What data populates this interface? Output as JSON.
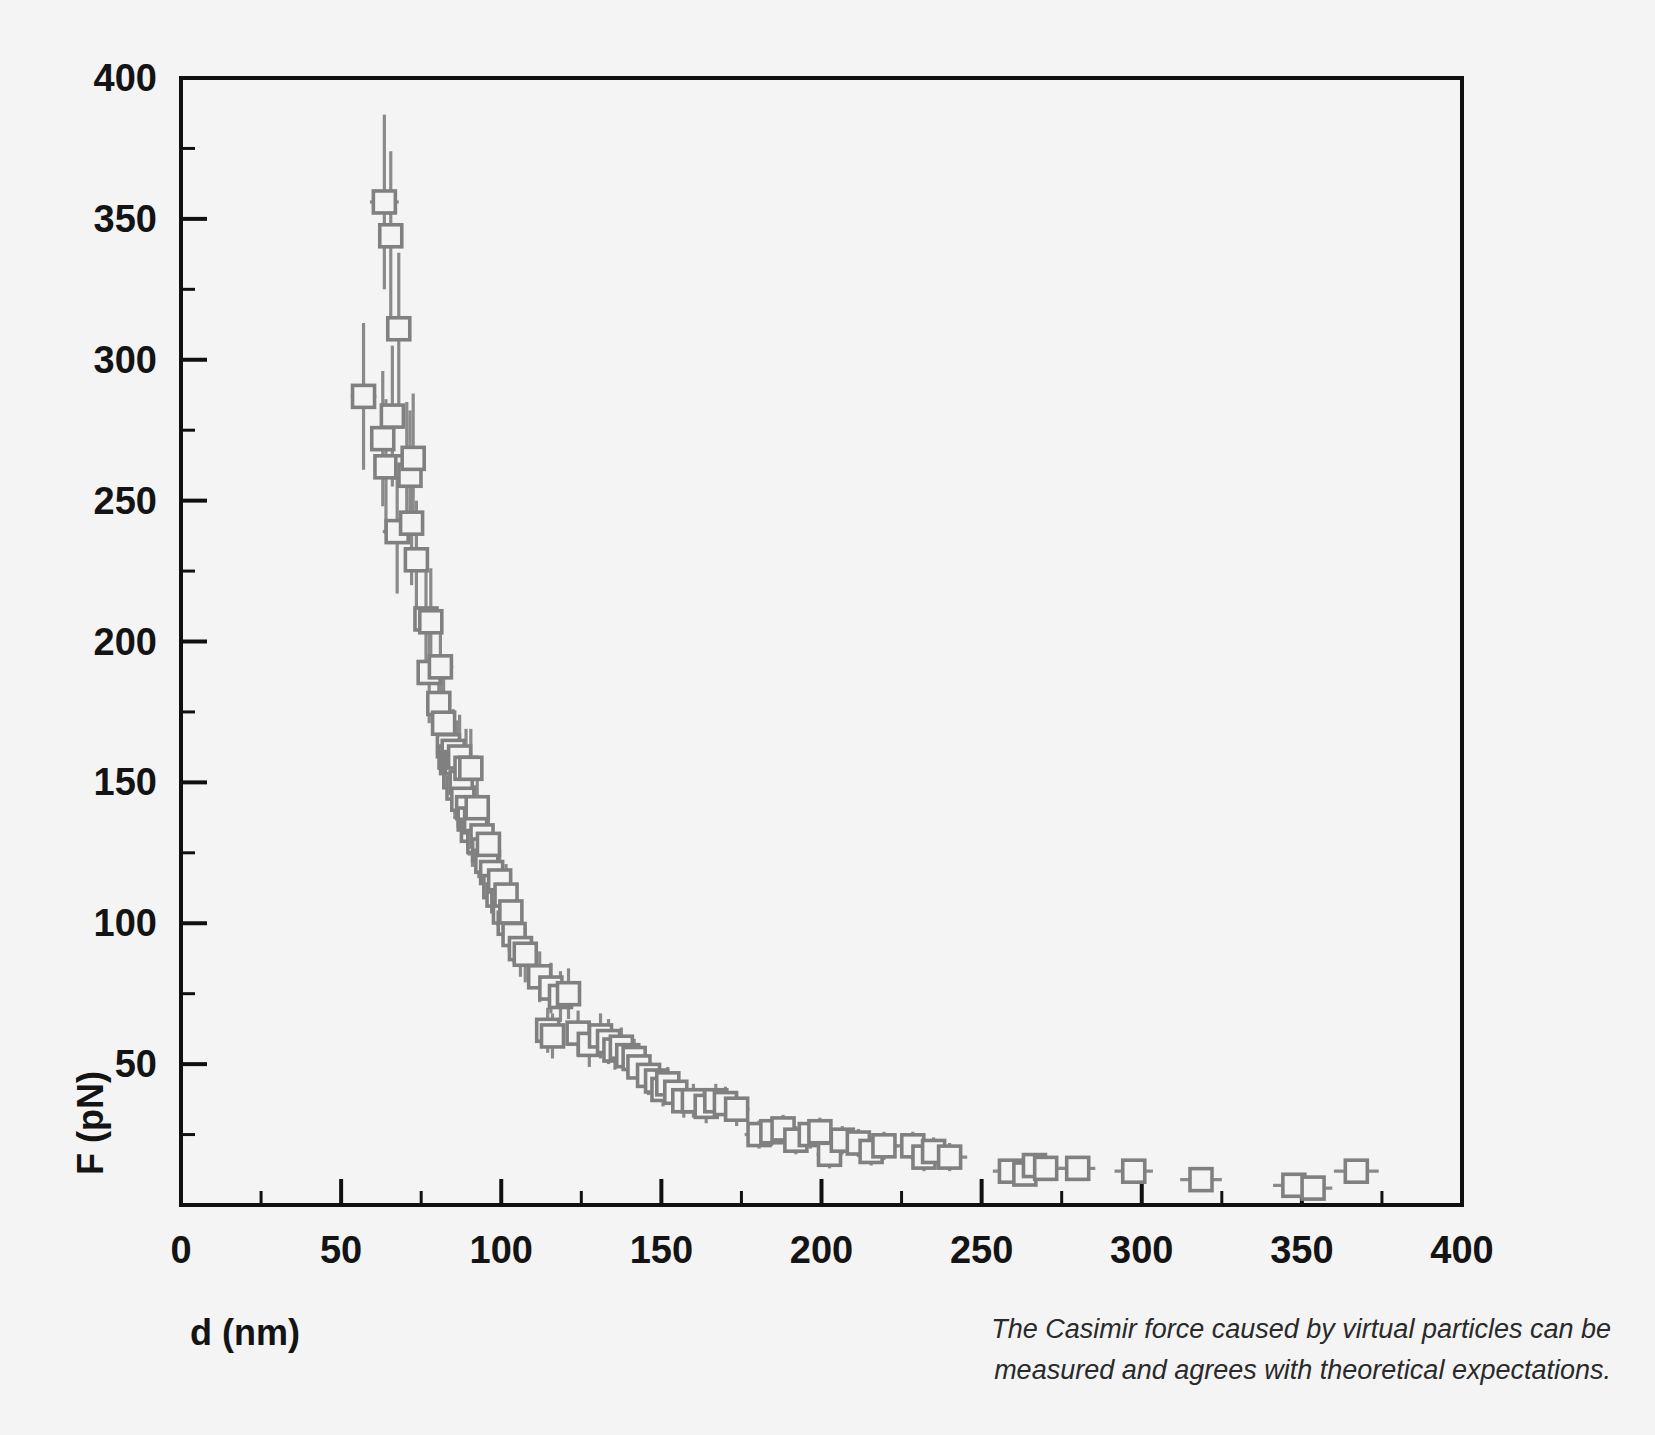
{
  "figure": {
    "background_color": "#f4f4f4",
    "frame_color": "#101010",
    "marker_color": "#808080",
    "errorbar_color": "#8a8a8a",
    "caption_line1": "The Casimir force caused by virtual particles can be",
    "caption_line2": "measured and agrees with theoretical expectations."
  },
  "chart_data": {
    "type": "scatter",
    "title": "",
    "xlabel": "d (nm)",
    "ylabel": "F (pN)",
    "xlim": [
      0,
      400
    ],
    "ylim": [
      0,
      400
    ],
    "xticks": [
      0,
      50,
      100,
      150,
      200,
      250,
      300,
      350,
      400
    ],
    "yticks": [
      0,
      50,
      100,
      150,
      200,
      250,
      300,
      350,
      400
    ],
    "xtick_labels": [
      "0",
      "50",
      "100",
      "150",
      "200",
      "250",
      "300",
      "350",
      "400"
    ],
    "ytick_labels": [
      "0",
      "50",
      "100",
      "150",
      "200",
      "250",
      "300",
      "350",
      "400"
    ],
    "xminor_step": 25,
    "yminor_step": 25,
    "grid": false,
    "legend": null,
    "marker": "open-square",
    "has_error_bars": true,
    "series": [
      {
        "name": "Casimir force measurement",
        "points": [
          {
            "x": 57.0,
            "y": 287,
            "xerr": 4.0,
            "yerr": 26
          },
          {
            "x": 63.5,
            "y": 356,
            "xerr": 4.5,
            "yerr": 31
          },
          {
            "x": 65.5,
            "y": 344,
            "xerr": 3.0,
            "yerr": 30
          },
          {
            "x": 64.0,
            "y": 262,
            "xerr": 3.5,
            "yerr": 24
          },
          {
            "x": 63.0,
            "y": 272,
            "xerr": 3.0,
            "yerr": 24
          },
          {
            "x": 66.0,
            "y": 280,
            "xerr": 3.5,
            "yerr": 25
          },
          {
            "x": 68.0,
            "y": 311,
            "xerr": 3.5,
            "yerr": 27
          },
          {
            "x": 67.5,
            "y": 239,
            "xerr": 4.5,
            "yerr": 22
          },
          {
            "x": 70.5,
            "y": 262,
            "xerr": 3.0,
            "yerr": 23
          },
          {
            "x": 71.5,
            "y": 259,
            "xerr": 3.5,
            "yerr": 23
          },
          {
            "x": 72.5,
            "y": 265,
            "xerr": 3.0,
            "yerr": 23
          },
          {
            "x": 72.0,
            "y": 242,
            "xerr": 3.5,
            "yerr": 22
          },
          {
            "x": 73.5,
            "y": 229,
            "xerr": 3.0,
            "yerr": 21
          },
          {
            "x": 76.5,
            "y": 208,
            "xerr": 3.0,
            "yerr": 19
          },
          {
            "x": 78.0,
            "y": 207,
            "xerr": 3.5,
            "yerr": 19
          },
          {
            "x": 77.5,
            "y": 189,
            "xerr": 3.5,
            "yerr": 18
          },
          {
            "x": 81.0,
            "y": 191,
            "xerr": 4.0,
            "yerr": 18
          },
          {
            "x": 80.5,
            "y": 178,
            "xerr": 3.0,
            "yerr": 17
          },
          {
            "x": 82.0,
            "y": 171,
            "xerr": 3.0,
            "yerr": 16
          },
          {
            "x": 83.5,
            "y": 163,
            "xerr": 3.0,
            "yerr": 16
          },
          {
            "x": 84.0,
            "y": 159,
            "xerr": 3.0,
            "yerr": 15
          },
          {
            "x": 84.5,
            "y": 157,
            "xerr": 3.0,
            "yerr": 15
          },
          {
            "x": 85.0,
            "y": 161,
            "xerr": 3.0,
            "yerr": 15
          },
          {
            "x": 85.5,
            "y": 152,
            "xerr": 3.0,
            "yerr": 15
          },
          {
            "x": 86.0,
            "y": 157,
            "xerr": 3.0,
            "yerr": 15
          },
          {
            "x": 86.5,
            "y": 148,
            "xerr": 3.0,
            "yerr": 14
          },
          {
            "x": 87.0,
            "y": 159,
            "xerr": 3.0,
            "yerr": 15
          },
          {
            "x": 87.5,
            "y": 150,
            "xerr": 3.0,
            "yerr": 14
          },
          {
            "x": 88.0,
            "y": 144,
            "xerr": 3.0,
            "yerr": 14
          },
          {
            "x": 89.0,
            "y": 155,
            "xerr": 3.0,
            "yerr": 14
          },
          {
            "x": 90.5,
            "y": 155,
            "xerr": 3.5,
            "yerr": 14
          },
          {
            "x": 89.5,
            "y": 141,
            "xerr": 3.0,
            "yerr": 14
          },
          {
            "x": 90.0,
            "y": 137,
            "xerr": 3.0,
            "yerr": 13
          },
          {
            "x": 91.0,
            "y": 133,
            "xerr": 3.0,
            "yerr": 13
          },
          {
            "x": 92.0,
            "y": 136,
            "xerr": 3.0,
            "yerr": 13
          },
          {
            "x": 93.0,
            "y": 129,
            "xerr": 3.0,
            "yerr": 13
          },
          {
            "x": 94.0,
            "y": 131,
            "xerr": 3.0,
            "yerr": 13
          },
          {
            "x": 94.5,
            "y": 126,
            "xerr": 3.0,
            "yerr": 12
          },
          {
            "x": 95.5,
            "y": 122,
            "xerr": 3.0,
            "yerr": 12
          },
          {
            "x": 96.0,
            "y": 128,
            "xerr": 3.0,
            "yerr": 12
          },
          {
            "x": 92.5,
            "y": 141,
            "xerr": 3.0,
            "yerr": 13
          },
          {
            "x": 97.0,
            "y": 118,
            "xerr": 3.0,
            "yerr": 12
          },
          {
            "x": 98.0,
            "y": 113,
            "xerr": 3.0,
            "yerr": 11
          },
          {
            "x": 99.0,
            "y": 110,
            "xerr": 3.0,
            "yerr": 11
          },
          {
            "x": 99.5,
            "y": 115,
            "xerr": 3.0,
            "yerr": 11
          },
          {
            "x": 100.5,
            "y": 108,
            "xerr": 3.0,
            "yerr": 11
          },
          {
            "x": 101.0,
            "y": 104,
            "xerr": 3.0,
            "yerr": 11
          },
          {
            "x": 101.5,
            "y": 110,
            "xerr": 3.0,
            "yerr": 11
          },
          {
            "x": 102.5,
            "y": 100,
            "xerr": 3.0,
            "yerr": 10
          },
          {
            "x": 103.0,
            "y": 104,
            "xerr": 3.0,
            "yerr": 10
          },
          {
            "x": 104.0,
            "y": 96,
            "xerr": 3.0,
            "yerr": 10
          },
          {
            "x": 106.0,
            "y": 91,
            "xerr": 3.5,
            "yerr": 10
          },
          {
            "x": 107.5,
            "y": 89,
            "xerr": 3.0,
            "yerr": 10
          },
          {
            "x": 112.0,
            "y": 81,
            "xerr": 3.5,
            "yerr": 9
          },
          {
            "x": 115.5,
            "y": 77,
            "xerr": 3.5,
            "yerr": 9
          },
          {
            "x": 114.5,
            "y": 62,
            "xerr": 3.0,
            "yerr": 8
          },
          {
            "x": 116.0,
            "y": 60,
            "xerr": 3.0,
            "yerr": 8
          },
          {
            "x": 118.5,
            "y": 74,
            "xerr": 4.0,
            "yerr": 9
          },
          {
            "x": 121.0,
            "y": 75,
            "xerr": 3.5,
            "yerr": 9
          },
          {
            "x": 124.0,
            "y": 61,
            "xerr": 3.5,
            "yerr": 8
          },
          {
            "x": 127.5,
            "y": 57,
            "xerr": 3.5,
            "yerr": 8
          },
          {
            "x": 131.0,
            "y": 60,
            "xerr": 3.5,
            "yerr": 8
          },
          {
            "x": 133.5,
            "y": 58,
            "xerr": 3.5,
            "yerr": 8
          },
          {
            "x": 135.5,
            "y": 55,
            "xerr": 3.5,
            "yerr": 7
          },
          {
            "x": 137.5,
            "y": 56,
            "xerr": 3.5,
            "yerr": 7
          },
          {
            "x": 139.5,
            "y": 53,
            "xerr": 3.5,
            "yerr": 7
          },
          {
            "x": 141.5,
            "y": 52,
            "xerr": 3.5,
            "yerr": 7
          },
          {
            "x": 143.0,
            "y": 49,
            "xerr": 3.0,
            "yerr": 7
          },
          {
            "x": 146.0,
            "y": 46,
            "xerr": 3.5,
            "yerr": 7
          },
          {
            "x": 148.5,
            "y": 44,
            "xerr": 3.5,
            "yerr": 6
          },
          {
            "x": 150.5,
            "y": 41,
            "xerr": 3.5,
            "yerr": 6
          },
          {
            "x": 152.0,
            "y": 43,
            "xerr": 3.5,
            "yerr": 6
          },
          {
            "x": 154.5,
            "y": 40,
            "xerr": 3.5,
            "yerr": 6
          },
          {
            "x": 157.0,
            "y": 37,
            "xerr": 3.5,
            "yerr": 6
          },
          {
            "x": 160.0,
            "y": 37,
            "xerr": 4.0,
            "yerr": 6
          },
          {
            "x": 164.0,
            "y": 35,
            "xerr": 4.0,
            "yerr": 6
          },
          {
            "x": 167.0,
            "y": 37,
            "xerr": 4.0,
            "yerr": 6
          },
          {
            "x": 170.0,
            "y": 36,
            "xerr": 4.0,
            "yerr": 6
          },
          {
            "x": 173.5,
            "y": 34,
            "xerr": 4.0,
            "yerr": 6
          },
          {
            "x": 180.5,
            "y": 25,
            "xerr": 4.5,
            "yerr": 5
          },
          {
            "x": 184.5,
            "y": 26,
            "xerr": 4.0,
            "yerr": 5
          },
          {
            "x": 188.0,
            "y": 27,
            "xerr": 4.0,
            "yerr": 5
          },
          {
            "x": 192.0,
            "y": 23,
            "xerr": 4.0,
            "yerr": 5
          },
          {
            "x": 196.5,
            "y": 25,
            "xerr": 4.5,
            "yerr": 5
          },
          {
            "x": 199.5,
            "y": 26,
            "xerr": 4.0,
            "yerr": 5
          },
          {
            "x": 202.5,
            "y": 18,
            "xerr": 4.0,
            "yerr": 5
          },
          {
            "x": 206.5,
            "y": 23,
            "xerr": 4.5,
            "yerr": 5
          },
          {
            "x": 211.5,
            "y": 22,
            "xerr": 4.5,
            "yerr": 5
          },
          {
            "x": 215.5,
            "y": 19,
            "xerr": 4.5,
            "yerr": 5
          },
          {
            "x": 219.5,
            "y": 21,
            "xerr": 4.5,
            "yerr": 5
          },
          {
            "x": 228.5,
            "y": 21,
            "xerr": 5.0,
            "yerr": 5
          },
          {
            "x": 232.0,
            "y": 17,
            "xerr": 4.5,
            "yerr": 5
          },
          {
            "x": 235.0,
            "y": 19,
            "xerr": 5.0,
            "yerr": 5
          },
          {
            "x": 240.0,
            "y": 17,
            "xerr": 5.5,
            "yerr": 5
          },
          {
            "x": 259.0,
            "y": 12,
            "xerr": 5.5,
            "yerr": 4
          },
          {
            "x": 263.5,
            "y": 11,
            "xerr": 5.0,
            "yerr": 4
          },
          {
            "x": 266.5,
            "y": 14,
            "xerr": 5.0,
            "yerr": 4
          },
          {
            "x": 270.0,
            "y": 13,
            "xerr": 5.0,
            "yerr": 4
          },
          {
            "x": 280.0,
            "y": 13,
            "xerr": 5.5,
            "yerr": 4
          },
          {
            "x": 297.5,
            "y": 12,
            "xerr": 6.0,
            "yerr": 4
          },
          {
            "x": 318.5,
            "y": 9,
            "xerr": 6.5,
            "yerr": 4
          },
          {
            "x": 347.5,
            "y": 7,
            "xerr": 6.5,
            "yerr": 4
          },
          {
            "x": 353.5,
            "y": 6,
            "xerr": 6.0,
            "yerr": 4
          },
          {
            "x": 367.0,
            "y": 12,
            "xerr": 7.0,
            "yerr": 4
          }
        ]
      }
    ]
  }
}
